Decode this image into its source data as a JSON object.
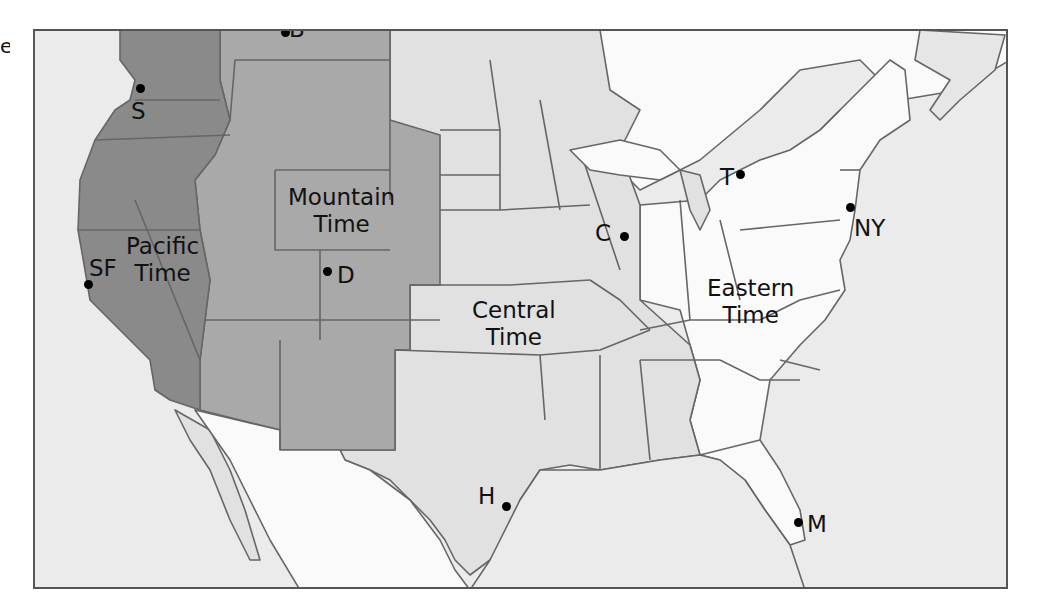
{
  "map": {
    "title": "US Time Zones",
    "edge_text": "e",
    "colors": {
      "pacific": "#8a8a8a",
      "mountain": "#a9a9a9",
      "central": "#e1e1e1",
      "eastern": "#fafafa",
      "ocean": "#ebebeb",
      "border": "#666666",
      "frame": "#555555"
    },
    "zones": [
      {
        "name": "Pacific",
        "line1": "Pacific",
        "line2": "Time"
      },
      {
        "name": "Mountain",
        "line1": "Mountain",
        "line2": "Time"
      },
      {
        "name": "Central",
        "line1": "Central",
        "line2": "Time"
      },
      {
        "name": "Eastern",
        "line1": "Eastern",
        "line2": "Time"
      }
    ],
    "cities": [
      {
        "code": "S",
        "zone": "Pacific"
      },
      {
        "code": "B",
        "zone": "Mountain"
      },
      {
        "code": "SF",
        "zone": "Pacific"
      },
      {
        "code": "D",
        "zone": "Mountain"
      },
      {
        "code": "C",
        "zone": "Central"
      },
      {
        "code": "T",
        "zone": "Eastern"
      },
      {
        "code": "NY",
        "zone": "Eastern"
      },
      {
        "code": "H",
        "zone": "Central"
      },
      {
        "code": "M",
        "zone": "Eastern"
      }
    ]
  }
}
